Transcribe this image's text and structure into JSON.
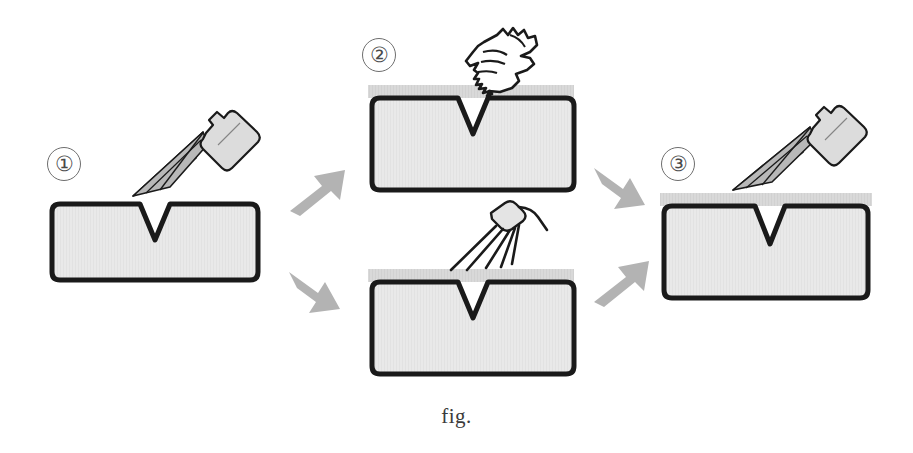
{
  "figure": {
    "caption": "fig.",
    "background_color": "#ffffff",
    "block_fill_color": "#e9e9e9",
    "block_outline_color": "#1a1a1a",
    "coating_band_color": "#d8d8d8",
    "arrow_color": "#b0b0b0",
    "spray_fill_color": "#9a9a9a",
    "step_circle_color": "#6e6e6e"
  },
  "steps": [
    {
      "id": "step-1",
      "number": "①",
      "label": "1",
      "tool": "spray-can-icon",
      "tool_label": "Penetrant spray can",
      "has_coating_band": false,
      "description": "Apply penetrant to the notched specimen with an aerosol spray can"
    },
    {
      "id": "step-2-upper",
      "number": "②",
      "label": "2",
      "tool": "hand-with-cloth-icon",
      "tool_label": "Hand wiping with cloth",
      "has_coating_band": true,
      "description": "Remove excess penetrant by wiping the coated surface with a cloth"
    },
    {
      "id": "step-2-lower",
      "number": "",
      "label": "",
      "tool": "water-nozzle-icon",
      "tool_label": "Water rinse nozzle",
      "has_coating_band": true,
      "description": "Remove excess penetrant by rinsing the coated surface with water spray"
    },
    {
      "id": "step-3",
      "number": "③",
      "label": "3",
      "tool": "spray-can-icon",
      "tool_label": "Developer spray can",
      "has_coating_band": true,
      "description": "Apply developer to the surface with an aerosol spray can"
    }
  ],
  "arrows": [
    {
      "id": "arrow-1-to-2-upper",
      "direction": "up-right",
      "from": "step-1",
      "to": "step-2-upper"
    },
    {
      "id": "arrow-1-to-2-lower",
      "direction": "down-right",
      "from": "step-1",
      "to": "step-2-lower"
    },
    {
      "id": "arrow-2-upper-to-3",
      "direction": "down-right",
      "from": "step-2-upper",
      "to": "step-3"
    },
    {
      "id": "arrow-2-lower-to-3",
      "direction": "up-right",
      "from": "step-2-lower",
      "to": "step-3"
    }
  ]
}
